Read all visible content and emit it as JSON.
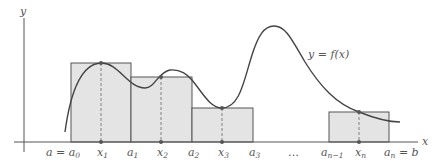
{
  "colors": {
    "background": "#ffffff",
    "axis": "#555555",
    "curve": "#444444",
    "rect_fill": "#e4e4e4",
    "rect_stroke": "#555555",
    "dashed": "#777777",
    "point": "#555555",
    "label": "#555555"
  },
  "axes": {
    "x_label": "x",
    "y_label": "y"
  },
  "curve": {
    "label": "y = f(x)"
  },
  "x_ticks": [
    {
      "id": "a0",
      "base": "a = a",
      "sub": "0"
    },
    {
      "id": "x1",
      "base": "x",
      "sub": "1"
    },
    {
      "id": "a1",
      "base": "a",
      "sub": "1"
    },
    {
      "id": "x2",
      "base": "x",
      "sub": "2"
    },
    {
      "id": "a2",
      "base": "a",
      "sub": "2"
    },
    {
      "id": "x3",
      "base": "x",
      "sub": "3"
    },
    {
      "id": "a3",
      "base": "a",
      "sub": "3"
    },
    {
      "id": "dots",
      "base": "…",
      "sub": ""
    },
    {
      "id": "an1",
      "base": "a",
      "sub": "n−1"
    },
    {
      "id": "xn",
      "base": "x",
      "sub": "n"
    },
    {
      "id": "an",
      "base": "a",
      "sub": "n",
      "suffix": " = b"
    }
  ],
  "rectangles": [
    {
      "name": "rect-1",
      "from": "a0",
      "to": "a1",
      "sample": "x1"
    },
    {
      "name": "rect-2",
      "from": "a1",
      "to": "a2",
      "sample": "x2"
    },
    {
      "name": "rect-3",
      "from": "a2",
      "to": "a3",
      "sample": "x3"
    },
    {
      "name": "rect-n",
      "from": "an1",
      "to": "an",
      "sample": "xn"
    }
  ]
}
